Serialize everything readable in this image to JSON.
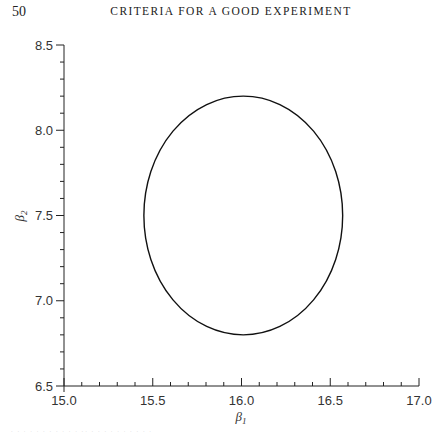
{
  "page": {
    "number": "50",
    "running_head": "CRITERIA FOR A GOOD EXPERIMENT"
  },
  "chart_data": {
    "type": "line",
    "title": "",
    "xlabel": "β1",
    "ylabel": "β2",
    "xlim": [
      15.0,
      17.0
    ],
    "ylim": [
      6.5,
      8.5
    ],
    "x_ticks": [
      "15.0",
      "15.5",
      "16.0",
      "16.5",
      "17.0"
    ],
    "y_ticks": [
      "6.5",
      "7.0",
      "7.5",
      "8.0",
      "8.5"
    ],
    "x_minor_step": 0.1,
    "y_minor_step": 0.1,
    "grid": false,
    "legend": null,
    "series": [
      {
        "name": "contour",
        "shape": "ellipse",
        "center": [
          16.01,
          7.5
        ],
        "semi_axis_x": 0.56,
        "semi_axis_y": 0.7,
        "extent_x": [
          15.45,
          16.57
        ],
        "extent_y": [
          6.8,
          8.2
        ],
        "color": "#111111"
      }
    ]
  },
  "labels": {
    "x_axis": "β",
    "x_axis_sub": "1",
    "y_axis": "β",
    "y_axis_sub": "2"
  },
  "caption_fragment": "· · · · · · · · ·  ·  · ·· · · · · · · · · · ·"
}
